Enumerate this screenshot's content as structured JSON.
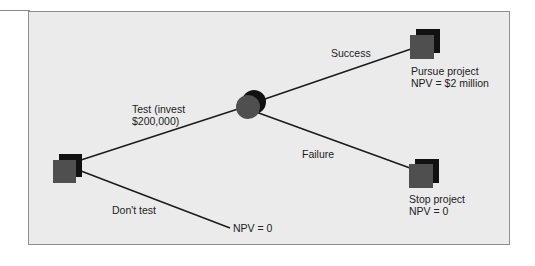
{
  "diagram": {
    "type": "decision-tree",
    "colors": {
      "background": "#ebebeb",
      "border": "#8f8f8f",
      "node_front": "#4f4f4f",
      "node_back": "#111111",
      "line": "#1a1a1a",
      "text": "#222222"
    },
    "nodes": [
      {
        "id": "decision",
        "kind": "decision-square"
      },
      {
        "id": "chance",
        "kind": "chance-circle"
      },
      {
        "id": "pursue",
        "kind": "terminal-square",
        "label_line1": "Pursue project",
        "label_line2": "NPV = $2 million"
      },
      {
        "id": "stop",
        "kind": "terminal-square",
        "label_line1": "Stop project",
        "label_line2": "NPV = 0"
      },
      {
        "id": "no-test-end",
        "kind": "endpoint",
        "label": "NPV = 0"
      }
    ],
    "branches": {
      "test": {
        "line1": "Test (invest",
        "line2": "$200,000)"
      },
      "dont_test": {
        "label": "Don't test"
      },
      "success": {
        "label": "Success"
      },
      "failure": {
        "label": "Failure"
      }
    }
  }
}
